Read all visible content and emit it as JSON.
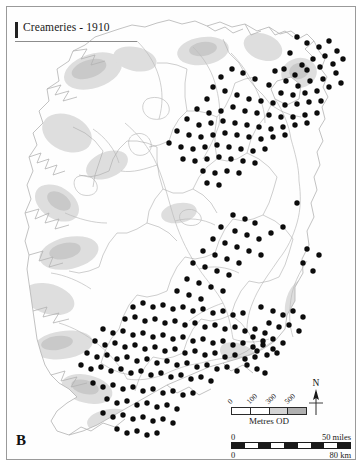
{
  "figure": {
    "panel_letter": "B",
    "title": "Creameries - 1910"
  },
  "map": {
    "region_name": "Ireland",
    "symbol_name": "creamery-dot",
    "coastline_color": "#b4b4b4",
    "river_color": "#b9b9b9",
    "border_color": "#a8a8a8",
    "relief_color": "#d8d8d8",
    "dot_color": "#0c0c0c",
    "background_color": "#ffffff"
  },
  "north_arrow": {
    "label": "N"
  },
  "elevation_legend": {
    "caption": "Metres OD",
    "ticks": [
      "0",
      "100",
      "300",
      "500"
    ],
    "band_colors": [
      "#ffffff",
      "#ffffff",
      "#d4d4d4",
      "#b0b0b0"
    ]
  },
  "distance_scale": {
    "miles_start": "0",
    "miles_end": "50 miles",
    "km_start": "0",
    "km_end": "80 km"
  },
  "chart_data": {
    "type": "scatter",
    "title": "Creameries - 1910",
    "xlabel": "",
    "ylabel": "",
    "projection": "map of Ireland",
    "grid": false,
    "legend_position": "bottom-right",
    "series": [
      {
        "name": "Creameries",
        "marker": "filled circle",
        "marker_color": "#0c0c0c",
        "count": 272,
        "points": [
          [
            290,
            30
          ],
          [
            300,
            36
          ],
          [
            312,
            40
          ],
          [
            322,
            34
          ],
          [
            330,
            44
          ],
          [
            318,
            49
          ],
          [
            306,
            52
          ],
          [
            295,
            58
          ],
          [
            283,
            46
          ],
          [
            277,
            62
          ],
          [
            288,
            68
          ],
          [
            300,
            63
          ],
          [
            313,
            60
          ],
          [
            326,
            57
          ],
          [
            336,
            52
          ],
          [
            329,
            66
          ],
          [
            316,
            72
          ],
          [
            303,
            74
          ],
          [
            291,
            79
          ],
          [
            279,
            74
          ],
          [
            268,
            64
          ],
          [
            262,
            78
          ],
          [
            274,
            86
          ],
          [
            286,
            88
          ],
          [
            298,
            86
          ],
          [
            310,
            84
          ],
          [
            322,
            80
          ],
          [
            334,
            76
          ],
          [
            248,
            72
          ],
          [
            236,
            66
          ],
          [
            225,
            62
          ],
          [
            214,
            70
          ],
          [
            206,
            80
          ],
          [
            218,
            84
          ],
          [
            230,
            88
          ],
          [
            242,
            92
          ],
          [
            254,
            94
          ],
          [
            266,
            96
          ],
          [
            278,
            98
          ],
          [
            290,
            97
          ],
          [
            302,
            95
          ],
          [
            314,
            94
          ],
          [
            200,
            92
          ],
          [
            190,
            102
          ],
          [
            202,
            106
          ],
          [
            214,
            104
          ],
          [
            226,
            100
          ],
          [
            238,
            104
          ],
          [
            250,
            106
          ],
          [
            262,
            108
          ],
          [
            274,
            110
          ],
          [
            286,
            110
          ],
          [
            298,
            108
          ],
          [
            310,
            106
          ],
          [
            180,
            112
          ],
          [
            192,
            118
          ],
          [
            204,
            116
          ],
          [
            216,
            114
          ],
          [
            228,
            116
          ],
          [
            240,
            118
          ],
          [
            252,
            120
          ],
          [
            264,
            122
          ],
          [
            276,
            120
          ],
          [
            288,
            118
          ],
          [
            300,
            116
          ],
          [
            170,
            124
          ],
          [
            182,
            128
          ],
          [
            194,
            130
          ],
          [
            206,
            128
          ],
          [
            218,
            126
          ],
          [
            230,
            128
          ],
          [
            242,
            130
          ],
          [
            254,
            132
          ],
          [
            266,
            130
          ],
          [
            278,
            128
          ],
          [
            162,
            136
          ],
          [
            174,
            140
          ],
          [
            186,
            142
          ],
          [
            198,
            140
          ],
          [
            210,
            138
          ],
          [
            222,
            140
          ],
          [
            234,
            142
          ],
          [
            246,
            144
          ],
          [
            258,
            142
          ],
          [
            176,
            152
          ],
          [
            188,
            154
          ],
          [
            200,
            152
          ],
          [
            212,
            150
          ],
          [
            224,
            152
          ],
          [
            236,
            154
          ],
          [
            248,
            156
          ],
          [
            196,
            164
          ],
          [
            208,
            166
          ],
          [
            220,
            164
          ],
          [
            232,
            166
          ],
          [
            200,
            176
          ],
          [
            212,
            178
          ],
          [
            290,
            196
          ],
          [
            126,
            300
          ],
          [
            136,
            296
          ],
          [
            146,
            300
          ],
          [
            156,
            298
          ],
          [
            166,
            302
          ],
          [
            176,
            300
          ],
          [
            186,
            304
          ],
          [
            196,
            302
          ],
          [
            206,
            306
          ],
          [
            216,
            304
          ],
          [
            226,
            308
          ],
          [
            236,
            306
          ],
          [
            118,
            312
          ],
          [
            128,
            310
          ],
          [
            138,
            314
          ],
          [
            148,
            312
          ],
          [
            158,
            316
          ],
          [
            168,
            314
          ],
          [
            178,
            318
          ],
          [
            188,
            316
          ],
          [
            198,
            320
          ],
          [
            208,
            318
          ],
          [
            218,
            322
          ],
          [
            228,
            320
          ],
          [
            238,
            324
          ],
          [
            248,
            322
          ],
          [
            258,
            326
          ],
          [
            96,
            322
          ],
          [
            106,
            326
          ],
          [
            116,
            324
          ],
          [
            126,
            328
          ],
          [
            136,
            326
          ],
          [
            146,
            330
          ],
          [
            156,
            328
          ],
          [
            166,
            332
          ],
          [
            176,
            330
          ],
          [
            186,
            334
          ],
          [
            196,
            332
          ],
          [
            206,
            336
          ],
          [
            216,
            334
          ],
          [
            226,
            338
          ],
          [
            236,
            336
          ],
          [
            246,
            340
          ],
          [
            256,
            338
          ],
          [
            266,
            342
          ],
          [
            88,
            334
          ],
          [
            98,
            338
          ],
          [
            108,
            336
          ],
          [
            118,
            340
          ],
          [
            128,
            338
          ],
          [
            138,
            342
          ],
          [
            148,
            340
          ],
          [
            158,
            344
          ],
          [
            168,
            342
          ],
          [
            178,
            346
          ],
          [
            188,
            344
          ],
          [
            198,
            348
          ],
          [
            208,
            346
          ],
          [
            218,
            350
          ],
          [
            228,
            348
          ],
          [
            238,
            352
          ],
          [
            248,
            350
          ],
          [
            80,
            346
          ],
          [
            90,
            350
          ],
          [
            100,
            348
          ],
          [
            110,
            352
          ],
          [
            120,
            350
          ],
          [
            130,
            354
          ],
          [
            140,
            352
          ],
          [
            150,
            356
          ],
          [
            160,
            354
          ],
          [
            170,
            358
          ],
          [
            180,
            356
          ],
          [
            190,
            360
          ],
          [
            200,
            358
          ],
          [
            210,
            362
          ],
          [
            220,
            360
          ],
          [
            230,
            364
          ],
          [
            74,
            358
          ],
          [
            84,
            362
          ],
          [
            94,
            360
          ],
          [
            104,
            364
          ],
          [
            114,
            362
          ],
          [
            124,
            366
          ],
          [
            134,
            364
          ],
          [
            144,
            368
          ],
          [
            154,
            366
          ],
          [
            164,
            370
          ],
          [
            174,
            368
          ],
          [
            184,
            372
          ],
          [
            194,
            370
          ],
          [
            204,
            374
          ],
          [
            86,
            376
          ],
          [
            96,
            380
          ],
          [
            106,
            378
          ],
          [
            116,
            382
          ],
          [
            126,
            380
          ],
          [
            136,
            384
          ],
          [
            146,
            382
          ],
          [
            156,
            386
          ],
          [
            166,
            384
          ],
          [
            176,
            388
          ],
          [
            186,
            386
          ],
          [
            100,
            392
          ],
          [
            110,
            396
          ],
          [
            120,
            394
          ],
          [
            130,
            398
          ],
          [
            140,
            396
          ],
          [
            150,
            400
          ],
          [
            160,
            398
          ],
          [
            170,
            402
          ],
          [
            96,
            406
          ],
          [
            106,
            410
          ],
          [
            116,
            408
          ],
          [
            126,
            412
          ],
          [
            136,
            410
          ],
          [
            146,
            414
          ],
          [
            156,
            412
          ],
          [
            166,
            416
          ],
          [
            110,
            422
          ],
          [
            120,
            426
          ],
          [
            130,
            424
          ],
          [
            140,
            428
          ],
          [
            150,
            426
          ],
          [
            254,
            300
          ],
          [
            266,
            304
          ],
          [
            276,
            308
          ],
          [
            286,
            304
          ],
          [
            296,
            310
          ],
          [
            262,
            316
          ],
          [
            272,
            320
          ],
          [
            282,
            318
          ],
          [
            292,
            324
          ],
          [
            246,
            330
          ],
          [
            256,
            334
          ],
          [
            266,
            332
          ],
          [
            276,
            336
          ],
          [
            250,
            344
          ],
          [
            260,
            348
          ],
          [
            270,
            346
          ],
          [
            240,
            358
          ],
          [
            250,
            362
          ],
          [
            258,
            366
          ],
          [
            300,
            242
          ],
          [
            312,
            248
          ],
          [
            296,
            256
          ],
          [
            306,
            264
          ],
          [
            226,
            208
          ],
          [
            238,
            212
          ],
          [
            248,
            216
          ],
          [
            214,
            220
          ],
          [
            228,
            224
          ],
          [
            240,
            228
          ],
          [
            252,
            232
          ],
          [
            264,
            226
          ],
          [
            276,
            220
          ],
          [
            206,
            232
          ],
          [
            218,
            236
          ],
          [
            230,
            240
          ],
          [
            242,
            244
          ],
          [
            254,
            248
          ],
          [
            196,
            244
          ],
          [
            208,
            248
          ],
          [
            220,
            252
          ],
          [
            232,
            256
          ],
          [
            186,
            256
          ],
          [
            198,
            260
          ],
          [
            210,
            264
          ],
          [
            222,
            268
          ],
          [
            180,
            272
          ],
          [
            192,
            276
          ],
          [
            204,
            280
          ],
          [
            216,
            284
          ],
          [
            170,
            284
          ],
          [
            182,
            288
          ],
          [
            194,
            292
          ]
        ]
      }
    ]
  }
}
